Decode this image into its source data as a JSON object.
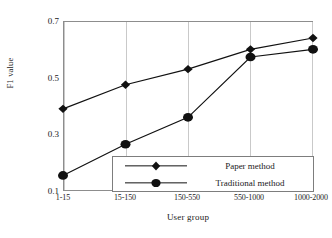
{
  "chart_data": {
    "type": "line",
    "title": "",
    "xlabel": "User group",
    "ylabel": "F1 value",
    "categories": [
      "1-15",
      "15-150",
      "150-550",
      "550-1000",
      "1000-2000"
    ],
    "ylim": [
      0.1,
      0.7
    ],
    "yticks": [
      0.7,
      0.5,
      0.3,
      0.1
    ],
    "ytick_labels": [
      "0.7",
      "0.5",
      "0.3",
      "0.1"
    ],
    "grid": "vertical",
    "legend_position": "inside-bottom-right",
    "series": [
      {
        "name": "Paper method",
        "marker": "diamond",
        "color": "#111111",
        "values": [
          0.39,
          0.475,
          0.53,
          0.6,
          0.64
        ]
      },
      {
        "name": "Traditional method",
        "marker": "circle",
        "color": "#111111",
        "values": [
          0.155,
          0.265,
          0.36,
          0.573,
          0.6
        ]
      }
    ]
  },
  "legend": {
    "items": [
      {
        "label": "Paper method",
        "marker": "diamond-marker-icon"
      },
      {
        "label": "Traditional method",
        "marker": "circle-marker-icon"
      }
    ]
  },
  "axes": {
    "y_title": "F1 value",
    "x_title": "User group"
  }
}
